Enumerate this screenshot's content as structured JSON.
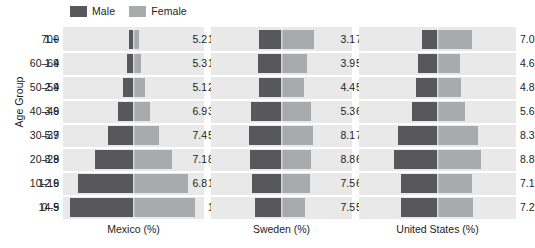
{
  "legend": {
    "entries": [
      {
        "label": "Male",
        "color": "#58585a"
      },
      {
        "label": "Female",
        "color": "#a9aaac"
      }
    ]
  },
  "axes": {
    "y_title": "Age Group",
    "age_groups": [
      "70+",
      "60–69",
      "50–59",
      "40–49",
      "30–39",
      "20–29",
      "10–19",
      "0–9"
    ]
  },
  "panels": [
    {
      "caption": "Mexico (%)"
    },
    {
      "caption": "Sweden (%)"
    },
    {
      "caption": "United States (%)"
    }
  ],
  "chart_data": {
    "type": "bar",
    "title": "",
    "subtitle": "",
    "xlabel": "",
    "ylabel": "Age Group",
    "orientation": "horizontal",
    "layout": "population-pyramid, 3 panels side by side, mirrored bars about a center line",
    "grid": "white gridlines between age-group rows and a white vertical center divider",
    "legend_position": "top-left, above first panel",
    "categories": [
      "70+",
      "60–69",
      "50–59",
      "40–49",
      "30–39",
      "20–29",
      "10–19",
      "0–9"
    ],
    "category_order": "oldest at top, youngest at bottom",
    "units": "percent of total population",
    "axis_max_percent": 16,
    "panels": [
      {
        "name": "Mexico",
        "caption": "Mexico (%)",
        "series": [
          {
            "name": "Male",
            "side": "left",
            "values": [
              1.0,
              1.4,
              2.4,
              3.6,
              5.7,
              8.8,
              12.6,
              14.5
            ],
            "labels": [
              "1.0",
              "1.4",
              "2.4",
              "3.6",
              "5.7",
              "8.8",
              "12.6",
              "14.5"
            ]
          },
          {
            "name": "Female",
            "side": "right",
            "values": [
              1.3,
              1.7,
              2.6,
              3.8,
              5.7,
              8.7,
              12.3,
              13.9
            ],
            "labels": [
              "1.3",
              "1.7",
              "2.6",
              "3.8",
              "5.7",
              "8.7",
              "12.3",
              "13.9"
            ]
          }
        ]
      },
      {
        "name": "Sweden",
        "caption": "Sweden (%)",
        "series": [
          {
            "name": "Male",
            "side": "left",
            "values": [
              5.2,
              5.3,
              5.1,
              6.9,
              7.4,
              7.1,
              6.8,
              6.0
            ],
            "labels": [
              "5.2",
              "5.3",
              "5.1",
              "6.9",
              "7.4",
              "7.1",
              "6.8",
              ""
            ]
          },
          {
            "name": "Female",
            "side": "right",
            "values": [
              7.4,
              5.7,
              5.2,
              6.6,
              7.1,
              6.8,
              6.5,
              5.3
            ],
            "labels": [
              "7.4",
              "5.7",
              "5.2",
              "6.6",
              "7.1",
              "6.8",
              "6.5",
              "5.3"
            ]
          }
        ]
      },
      {
        "name": "United States",
        "caption": "United States (%)",
        "series": [
          {
            "name": "Male",
            "side": "left",
            "values": [
              3.1,
              3.9,
              4.4,
              5.3,
              8.1,
              8.8,
              7.5,
              7.5
            ],
            "labels": [
              "3.1",
              "3.9",
              "4.4",
              "5.3",
              "8.1",
              "8.8",
              "7.5",
              "7.5"
            ]
          },
          {
            "name": "Female",
            "side": "right",
            "values": [
              7.0,
              4.6,
              4.8,
              5.6,
              8.3,
              8.8,
              7.1,
              7.2
            ],
            "labels": [
              "7.0",
              "4.6",
              "4.8",
              "5.6",
              "8.3",
              "8.8",
              "7.1",
              "7.2"
            ]
          }
        ]
      }
    ],
    "colors": {
      "male": "#58585a",
      "female": "#a9aaac",
      "panel_background": "#e9e9e9",
      "gridline": "#ffffff",
      "text": "#1c1c1c",
      "figure_background": "#ffffff"
    }
  }
}
